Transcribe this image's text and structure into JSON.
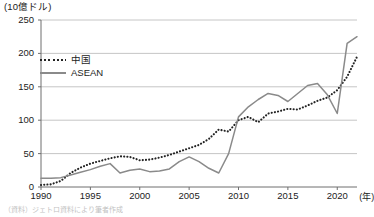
{
  "chart_data": {
    "type": "line",
    "title": "(10億ドル)",
    "xlabel": "(年)",
    "ylabel": "(10億ドル)",
    "xlim": [
      1990,
      2022
    ],
    "ylim": [
      0,
      250
    ],
    "grid": true,
    "legend_position": "upper-left-inside",
    "xticks": [
      "1990",
      "1995",
      "2000",
      "2005",
      "2010",
      "2015",
      "2020"
    ],
    "xtick_values": [
      1990,
      1995,
      2000,
      2005,
      2010,
      2015,
      2020
    ],
    "yticks": [
      "0",
      "50",
      "100",
      "150",
      "200",
      "250"
    ],
    "ytick_values": [
      0,
      50,
      100,
      150,
      200,
      250
    ],
    "x": [
      1990,
      1991,
      1992,
      1993,
      1994,
      1995,
      1996,
      1997,
      1998,
      1999,
      2000,
      2001,
      2002,
      2003,
      2004,
      2005,
      2006,
      2007,
      2008,
      2009,
      2010,
      2011,
      2012,
      2013,
      2014,
      2015,
      2016,
      2017,
      2018,
      2019,
      2020,
      2021,
      2022
    ],
    "series": [
      {
        "name": "中国",
        "style": "dotted",
        "color": "#232323",
        "values": [
          3,
          4,
          9,
          21,
          29,
          35,
          39,
          43,
          46,
          45,
          40,
          41,
          44,
          48,
          53,
          58,
          63,
          72,
          86,
          83,
          100,
          105,
          97,
          110,
          113,
          117,
          116,
          122,
          129,
          134,
          145,
          165,
          195
        ]
      },
      {
        "name": "ASEAN",
        "style": "solid",
        "color": "#8a8a8a",
        "values": [
          13,
          13,
          14,
          18,
          22,
          26,
          31,
          35,
          21,
          25,
          27,
          23,
          24,
          27,
          38,
          45,
          38,
          28,
          21,
          50,
          105,
          120,
          131,
          140,
          137,
          128,
          140,
          152,
          155,
          138,
          110,
          215,
          225
        ]
      }
    ]
  },
  "axis": {
    "unit_title": "(10億ドル)",
    "x_unit": "(年)"
  },
  "legend": {
    "items": [
      {
        "label": "中国",
        "style": "dotted"
      },
      {
        "label": "ASEAN",
        "style": "solid"
      }
    ]
  },
  "source": {
    "text": "（資料）ジェトロ資料により筆者作成"
  },
  "colors": {
    "china_line": "#232323",
    "asean_line": "#8a8a8a",
    "gridline": "#bfbfbf",
    "axis": "#6f6f6f",
    "background": "#ffffff"
  }
}
